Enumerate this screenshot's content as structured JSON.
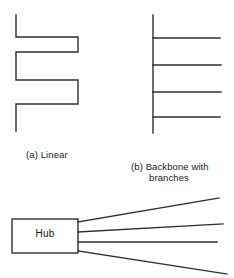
{
  "figure": {
    "background_color": "#ffffff",
    "stroke_color": "#2b2f33",
    "text_color": "#16191c",
    "panels": [
      {
        "id": "linear",
        "caption_tag": "(a)",
        "caption_text": "Linear",
        "caption_full": "(a)  Linear",
        "topology": "linear serpentine bus cable",
        "segments": 7
      },
      {
        "id": "backbone",
        "caption_tag": "(b)",
        "caption_line1": "(b)  Backbone with",
        "caption_line2": "branches",
        "caption_text": "Backbone with branches",
        "topology": "vertical backbone with horizontal branches",
        "branch_count": 4
      },
      {
        "id": "hub",
        "box_label": "Hub",
        "topology": "star hub with radiating links",
        "link_count": 4
      }
    ]
  },
  "chart_data": {
    "type": "diagram",
    "title": "",
    "geometry": {
      "width": 234,
      "height": 278,
      "stroke_width": 1.4
    },
    "linear_polyline": [
      [
        16,
        15
      ],
      [
        16,
        37
      ],
      [
        78,
        37
      ],
      [
        78,
        52
      ],
      [
        16,
        52
      ],
      [
        16,
        80
      ],
      [
        78,
        80
      ],
      [
        78,
        104
      ],
      [
        16,
        104
      ],
      [
        16,
        131
      ]
    ],
    "backbone": {
      "spine": [
        [
          153,
          15
        ],
        [
          153,
          133
        ]
      ],
      "branches": [
        [
          [
            153,
            38
          ],
          [
            220,
            38
          ]
        ],
        [
          [
            153,
            65
          ],
          [
            221,
            65
          ]
        ],
        [
          [
            153,
            92
          ],
          [
            221,
            92
          ]
        ],
        [
          [
            153,
            117
          ],
          [
            220,
            117
          ]
        ]
      ]
    },
    "hub": {
      "box": {
        "x": 12,
        "y": 219,
        "width": 66,
        "height": 34
      },
      "label": "Hub",
      "links": [
        [
          [
            78,
            222
          ],
          [
            219,
            198
          ]
        ],
        [
          [
            78,
            232
          ],
          [
            223,
            224
          ]
        ],
        [
          [
            78,
            242
          ],
          [
            217,
            242
          ]
        ],
        [
          [
            78,
            251
          ],
          [
            227,
            274
          ]
        ]
      ]
    }
  }
}
